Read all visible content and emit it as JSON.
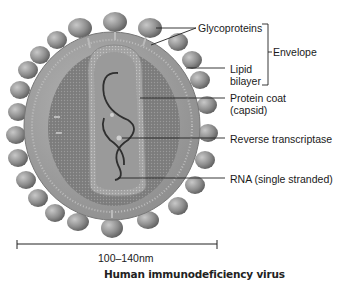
{
  "title": "Human immunodeficiency virus",
  "scale_bar": {
    "label": "100–140nm"
  },
  "labels": {
    "glycoproteins": "Glycoproteins",
    "envelope": "Envelope",
    "lipid_line1": "Lipid",
    "lipid_line2": "bilayer",
    "capsid_line1": "Protein coat",
    "capsid_line2": "(capsid)",
    "reverse_transcriptase": "Reverse transcriptase",
    "rna": "RNA (single stranded)"
  },
  "colors": {
    "envelope_fill": "#9c9c9c",
    "knob_fill": "#8a8a8a",
    "capsid_fill": "#7a7a7a",
    "core_fill": "#a8a8a8",
    "rna_stroke": "#333333",
    "text": "#1a1a1a"
  }
}
